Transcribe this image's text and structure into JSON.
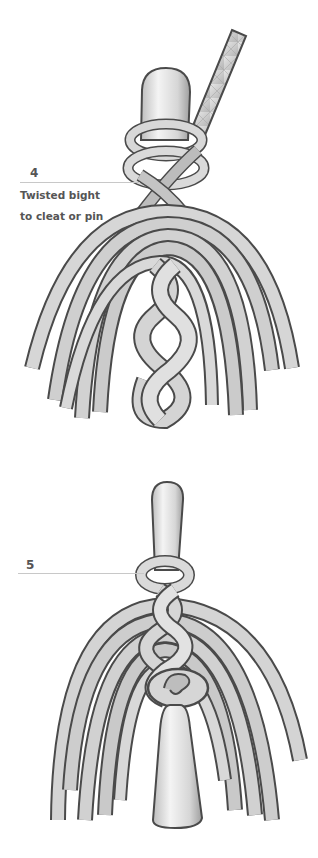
{
  "steps": [
    {
      "number": "4",
      "caption_line1": "Twisted bight",
      "caption_line2": "to cleat or pin"
    },
    {
      "number": "5"
    }
  ],
  "colors": {
    "text": "#555555",
    "leader_line": "#c8c8c8",
    "rope_outline": "#4a4a4a",
    "rope_fill": "#d0d0d0",
    "pin_fill": "#e4e4e4"
  }
}
